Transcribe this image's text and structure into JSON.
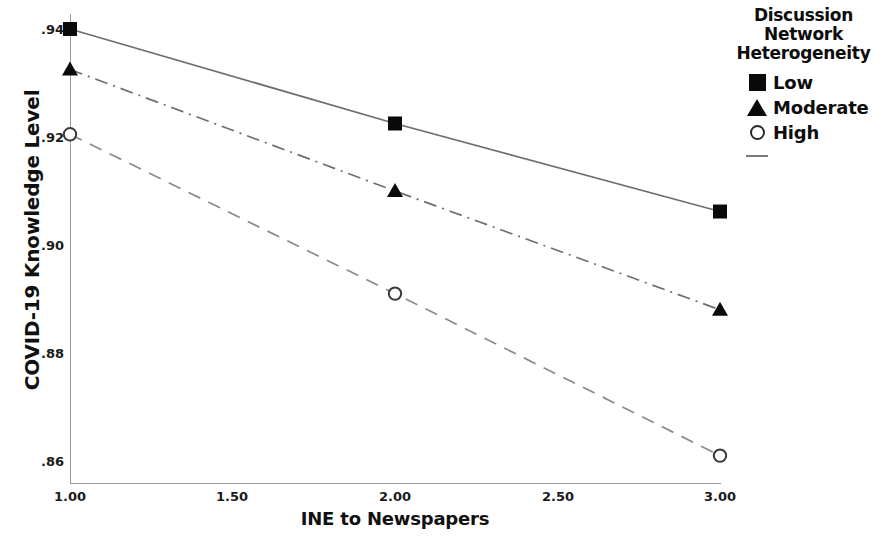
{
  "chart_data": {
    "type": "line",
    "title": "",
    "xlabel": "INE to Newspapers",
    "ylabel": "COVID-19 Knowledge Level",
    "x": [
      1.0,
      2.0,
      3.0
    ],
    "xtick_labels": [
      "1.00",
      "1.50",
      "2.00",
      "2.50",
      "3.00"
    ],
    "xtick_values": [
      1.0,
      1.5,
      2.0,
      2.5,
      3.0
    ],
    "ytick_labels": [
      ".94",
      ".92",
      ".90",
      ".88",
      ".86"
    ],
    "ytick_values": [
      0.94,
      0.92,
      0.9,
      0.88,
      0.86
    ],
    "xlim": [
      1.0,
      3.0
    ],
    "ylim": [
      0.8555,
      0.9435
    ],
    "grid": false,
    "legend_position": "right",
    "legend_title": "Discussion Network Heterogeneity",
    "series": [
      {
        "name": "Low",
        "marker": "filled-square",
        "linestyle": "solid",
        "color": "#6e6e6e",
        "marker_color": "#0a0a0a",
        "values": [
          0.94,
          0.9225,
          0.9062
        ]
      },
      {
        "name": "Moderate",
        "marker": "filled-triangle",
        "linestyle": "dash-dot",
        "color": "#6e6e6e",
        "marker_color": "#0a0a0a",
        "values": [
          0.9325,
          0.91,
          0.888
        ]
      },
      {
        "name": "High",
        "marker": "open-circle",
        "linestyle": "dashed",
        "color": "#8a8a8a",
        "marker_color": "#3a3a3a",
        "values": [
          0.9205,
          0.891,
          0.861
        ]
      }
    ]
  },
  "legend": {
    "title_line_1": "Discussion",
    "title_line_2": "Network",
    "title_line_3": "Heterogeneity",
    "items": [
      {
        "label": "Low",
        "key": "filled-square-key"
      },
      {
        "label": "Moderate",
        "key": "filled-triangle-key"
      },
      {
        "label": "High",
        "key": "open-circle-key"
      }
    ],
    "line_sample": ""
  },
  "axes": {
    "y_title": "COVID-19 Knowledge Level",
    "x_title": "INE to Newspapers",
    "y_ticks": [
      ".94",
      ".92",
      ".90",
      ".88",
      ".86"
    ],
    "x_ticks": [
      "1.00",
      "1.50",
      "2.00",
      "2.50",
      "3.00"
    ]
  }
}
